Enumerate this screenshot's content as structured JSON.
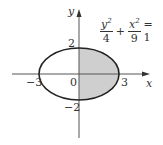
{
  "figure": {
    "equation": {
      "term1_num": "y",
      "term1_exp": "2",
      "term1_den": "4",
      "plus": "+",
      "term2_num": "x",
      "term2_exp": "2",
      "term2_den": "9",
      "equals": "= 1"
    },
    "axes": {
      "x_label": "x",
      "y_label": "y"
    },
    "ticks": {
      "x_neg": "−3",
      "x_pos": "3",
      "y_pos": "2",
      "y_neg": "−2",
      "origin": "0"
    },
    "colors": {
      "shade": "#cfcfcf",
      "stroke": "#222222",
      "axis": "#555555"
    }
  }
}
